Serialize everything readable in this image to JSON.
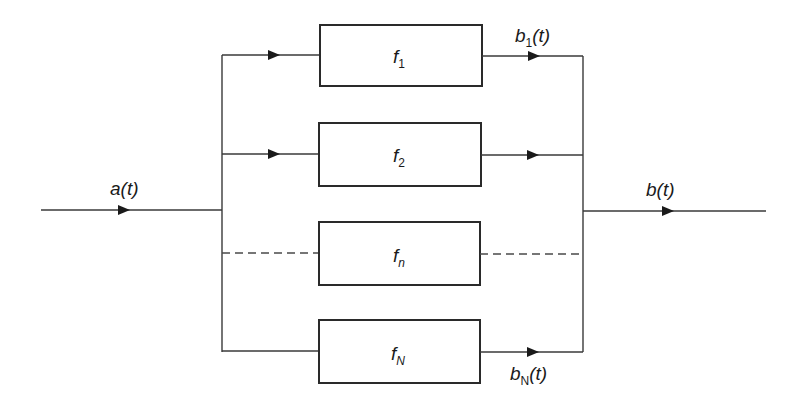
{
  "diagram": {
    "type": "parallel system block diagram",
    "input": {
      "label": "a",
      "arg": "(t)"
    },
    "output": {
      "label": "b",
      "arg": "(t)"
    },
    "blocks": [
      {
        "name": "f",
        "sub": "1",
        "sub_italic": false,
        "line_style": "solid",
        "output_label": {
          "label": "b",
          "sub": "1",
          "arg": "(t)"
        }
      },
      {
        "name": "f",
        "sub": "2",
        "sub_italic": false,
        "line_style": "solid"
      },
      {
        "name": "f",
        "sub": "n",
        "sub_italic": true,
        "line_style": "dashed"
      },
      {
        "name": "f",
        "sub": "N",
        "sub_italic": true,
        "line_style": "solid",
        "output_label": {
          "label": "b",
          "sub": "N",
          "arg": "(t)"
        }
      }
    ],
    "colors": {
      "line": "#3a3a3a",
      "box_border": "#2a2a2a",
      "background": "#ffffff"
    }
  }
}
